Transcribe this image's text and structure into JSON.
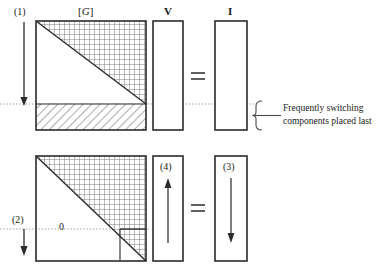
{
  "diagram": {
    "title_labels": {
      "matrix_label": "[G]",
      "matrix_label_bracket_open": "[",
      "matrix_label_symbol": "G",
      "matrix_label_bracket_close": "]",
      "vector_v_label": "V",
      "vector_i_label": "I"
    },
    "step_tags": {
      "step1": "(1)",
      "step2": "(2)",
      "step3": "(3)",
      "step4": "(4)"
    },
    "operators": {
      "equals_top": "=",
      "equals_bottom": "="
    },
    "annotations": {
      "zero_label": "0",
      "brace_note_line1": "Frequently switching",
      "brace_note_line2": "components placed last"
    },
    "colors": {
      "stroke": "#2b2b2b",
      "hatch": "#555555",
      "grid": "#6a6a6a",
      "dotted": "#9a9a9a",
      "background": "#ffffff"
    },
    "geometry": {
      "top_matrix": {
        "x": 36,
        "y": 21,
        "w": 110,
        "h": 109,
        "band_top": 104
      },
      "bottom_matrix": {
        "x": 36,
        "y": 156,
        "w": 110,
        "h": 105,
        "sub_block": 26
      },
      "v_column_top": {
        "x": 153,
        "y": 21,
        "w": 30,
        "h": 109
      },
      "i_column_top": {
        "x": 215,
        "y": 21,
        "w": 32,
        "h": 109
      },
      "v_column_bottom": {
        "x": 153,
        "y": 156,
        "w": 30,
        "h": 105
      },
      "i_column_bottom": {
        "x": 215,
        "y": 156,
        "w": 32,
        "h": 105
      },
      "dotted_line_y_top": 104,
      "dotted_line_y_bottom": 229
    }
  }
}
